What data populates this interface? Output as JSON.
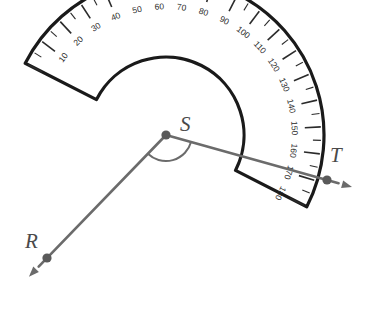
{
  "figure": {
    "title": "Protractor measuring angle RST",
    "type": "geometry-diagram",
    "background_color": "#ffffff"
  },
  "colors": {
    "protractor_outline": "#1a1a1a",
    "tick": "#2b2b2b",
    "tick_label": "#2b2b2b",
    "ray": "#6b6b6b",
    "point_dot": "#5a5a5a",
    "point_label": "#4a4a4a"
  },
  "protractor": {
    "center_x": 166,
    "center_y": 135,
    "outer_radius": 158,
    "scale_radius": 140,
    "inner_cut_radius": 78,
    "rotation_deg": -27,
    "baseline_start_deg": 0,
    "baseline_end_deg": 180,
    "tick_major_step": 10,
    "tick_minor_step": 5
  },
  "scale": {
    "labels": [
      {
        "value": "10",
        "deg": 10
      },
      {
        "value": "20",
        "deg": 20
      },
      {
        "value": "30",
        "deg": 30
      },
      {
        "value": "40",
        "deg": 40
      },
      {
        "value": "50",
        "deg": 50
      },
      {
        "value": "60",
        "deg": 60
      },
      {
        "value": "70",
        "deg": 70
      },
      {
        "value": "80",
        "deg": 80
      },
      {
        "value": "90",
        "deg": 90
      },
      {
        "value": "100",
        "deg": 100
      },
      {
        "value": "110",
        "deg": 110
      },
      {
        "value": "120",
        "deg": 120
      },
      {
        "value": "130",
        "deg": 130
      },
      {
        "value": "140",
        "deg": 140
      },
      {
        "value": "150",
        "deg": 150
      },
      {
        "value": "160",
        "deg": 160
      },
      {
        "value": "170",
        "deg": 170
      },
      {
        "value": "180",
        "deg": 180
      }
    ]
  },
  "points": [
    {
      "name": "R",
      "label": "R",
      "x": 47,
      "y": 258,
      "label_x": 25,
      "label_y": 248
    },
    {
      "name": "S",
      "label": "S",
      "x": 166,
      "y": 135,
      "label_x": 180,
      "label_y": 131
    },
    {
      "name": "T",
      "label": "T",
      "x": 327,
      "y": 180,
      "label_x": 330,
      "label_y": 162
    }
  ],
  "rays": [
    {
      "name": "ray-SR",
      "from": "S",
      "through": "R",
      "reading_deg": 0
    },
    {
      "name": "ray-ST",
      "from": "S",
      "through": "T",
      "reading_deg": 125
    }
  ],
  "angle_mark": {
    "name": "angle-RST",
    "vertex": "S",
    "radius": 26
  }
}
